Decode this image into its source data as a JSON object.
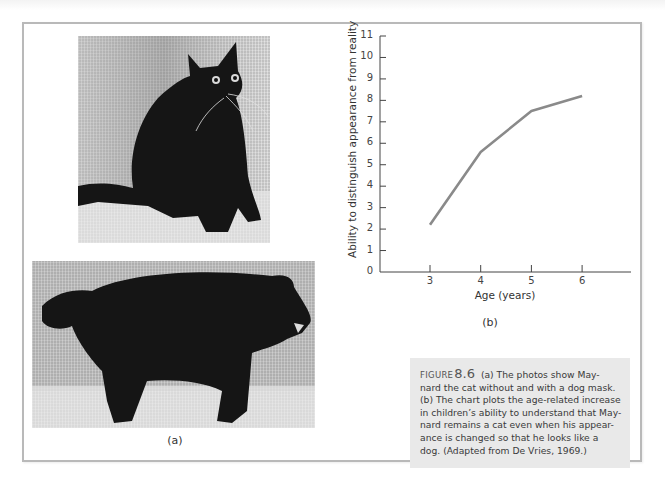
{
  "figure": {
    "label_a": "(a)",
    "label_b": "(b)",
    "caption": {
      "figure_word": "FIGURE",
      "figure_number": "8.6",
      "lines": [
        "(a) The photos show May-",
        "nard the cat without and with a dog mask.",
        "(b) The chart plots the age-related increase",
        "in children’s ability to understand that May-",
        "nard remains a cat even when his appear-",
        "ance is changed so that he looks like a",
        "dog. (Adapted from De Vries, 1969.)"
      ]
    },
    "photos": [
      {
        "name": "cat-without-mask",
        "description": "Black cat sitting"
      },
      {
        "name": "cat-with-dog-mask",
        "description": "Black cat wearing dog mask, standing"
      }
    ]
  },
  "chart_data": {
    "type": "line",
    "title": "",
    "xlabel": "Age (years)",
    "ylabel": "Ability to distinguish appearance from reality",
    "x": [
      3,
      4,
      5,
      6
    ],
    "categories": [
      "3",
      "4",
      "5",
      "6"
    ],
    "values": [
      2.2,
      5.6,
      7.5,
      8.2
    ],
    "series": [
      {
        "name": "Ability",
        "values": [
          2.2,
          5.6,
          7.5,
          8.2
        ],
        "color": "#8a8a8a"
      }
    ],
    "xticks": [
      "3",
      "4",
      "5",
      "6"
    ],
    "yticks": [
      "0",
      "1",
      "2",
      "3",
      "4",
      "5",
      "6",
      "7",
      "8",
      "9",
      "10",
      "11"
    ],
    "ylim": [
      0,
      11
    ],
    "xlim": [
      2,
      7
    ],
    "grid": false,
    "legend": null
  }
}
